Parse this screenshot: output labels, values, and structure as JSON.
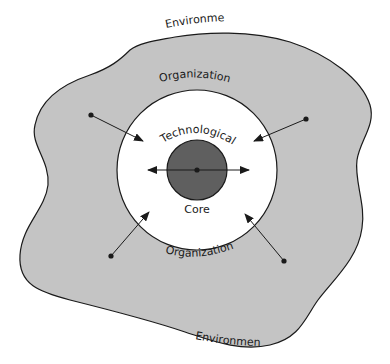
{
  "diagram": {
    "labels": {
      "environment_top": "Environment",
      "environment_bottom": "Environment",
      "organization_top": "Organization",
      "organization_bottom": "Organization",
      "core_top": "Technological",
      "core_bottom": "Core"
    },
    "colors": {
      "environment_fill": "#c4c4c4",
      "organization_fill": "#ffffff",
      "core_fill": "#5f5f5f",
      "stroke": "#1a1a1a"
    }
  }
}
